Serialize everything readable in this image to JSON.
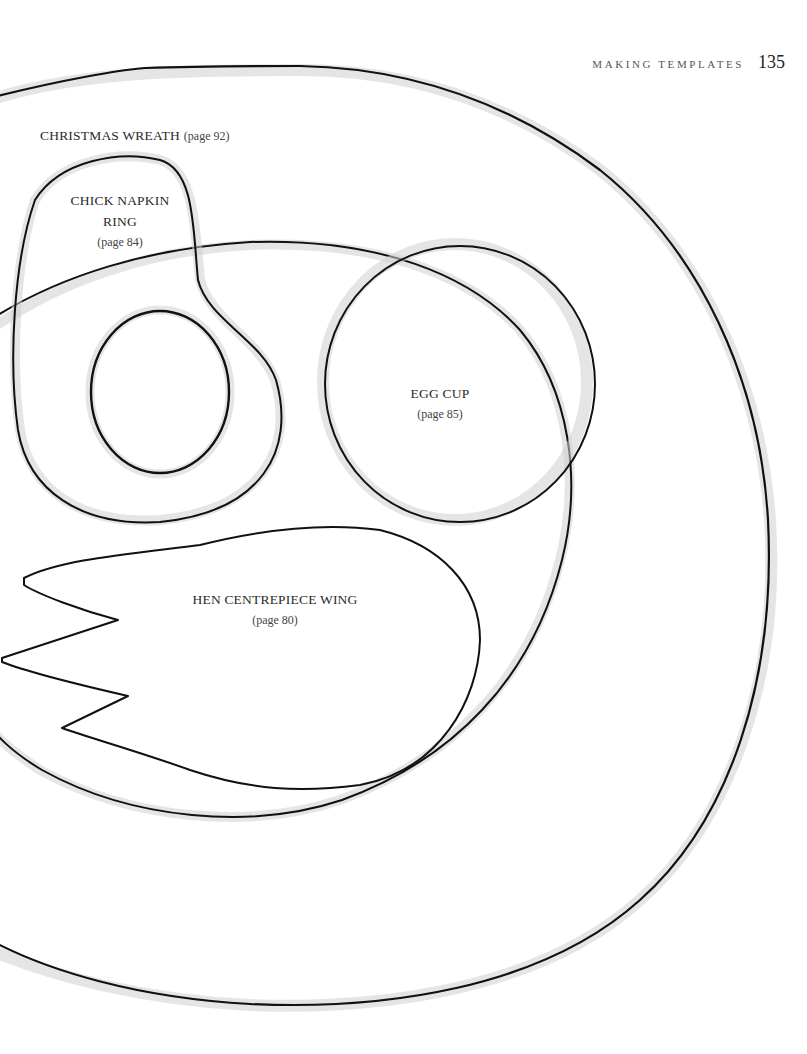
{
  "header": {
    "running_head": "MAKING TEMPLATES",
    "page_number": "135"
  },
  "templates": [
    {
      "name": "CHRISTMAS WREATH",
      "page_ref": "(page 92)"
    },
    {
      "name_line1": "CHICK NAPKIN",
      "name_line2": "RING",
      "page_ref": "(page 84)"
    },
    {
      "name": "EGG CUP",
      "page_ref": "(page 85)"
    },
    {
      "name": "HEN CENTREPIECE WING",
      "page_ref": "(page 80)"
    }
  ],
  "colors": {
    "ink": "#111111",
    "wash": "#cfcfcf",
    "paper": "#ffffff"
  }
}
